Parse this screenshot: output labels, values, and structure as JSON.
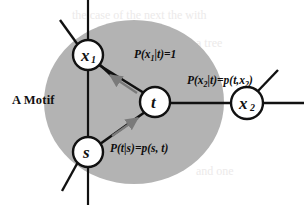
{
  "figure": {
    "title_text": "A Motif",
    "background_color": "#ffffff",
    "motif_region": {
      "name": "motif-ellipse",
      "fill_color": "#b3b3b3",
      "cx": 134,
      "cy": 102,
      "rx": 90,
      "ry": 82
    },
    "nodes": [
      {
        "id": "x1",
        "base": "x",
        "subscript": "1",
        "cx": 88,
        "cy": 55,
        "r": 15,
        "inside_motif": true
      },
      {
        "id": "t",
        "base": "t",
        "subscript": "",
        "cx": 155,
        "cy": 102,
        "r": 15,
        "inside_motif": true
      },
      {
        "id": "s",
        "base": "s",
        "subscript": "",
        "cx": 88,
        "cy": 152,
        "r": 15,
        "inside_motif": true
      },
      {
        "id": "x2",
        "base": "x",
        "subscript": "2",
        "cx": 247,
        "cy": 103,
        "r": 16,
        "inside_motif": false
      }
    ],
    "edge_labels": [
      {
        "id": "label-x1-t",
        "text": "P(x1|t)=1",
        "display": "P(x|t)=1",
        "x": 108,
        "y": 58
      },
      {
        "id": "label-t-x2",
        "text": "P(x2|t)=p(t,x2)",
        "display": "P(x|t)=p(t,x)",
        "x": 163,
        "y": 84
      },
      {
        "id": "label-s-t",
        "text": "P(t|s)=p(s, t)",
        "display": "P(t|s)=p(s, t)",
        "x": 110,
        "y": 152
      }
    ],
    "arrows": [
      {
        "id": "arrow-t-to-x1",
        "from": "t",
        "to": "x1",
        "color": "#7a7a7a",
        "direction": "up-left"
      },
      {
        "id": "arrow-s-to-t",
        "from": "s",
        "to": "t",
        "color": "#7a7a7a",
        "direction": "up-right"
      }
    ],
    "edges": [
      {
        "id": "edge-x1-t",
        "from": "x1",
        "to": "t",
        "color": "#111111"
      },
      {
        "id": "edge-s-t",
        "from": "s",
        "to": "t",
        "color": "#111111"
      },
      {
        "id": "edge-t-x2",
        "from": "t",
        "to": "x2",
        "color": "#111111"
      }
    ],
    "external_lines": [
      {
        "id": "vertical-backbone-line",
        "orientation": "vertical",
        "x": 88
      },
      {
        "id": "stub-x1-upleft",
        "orientation": "diagonal"
      },
      {
        "id": "stub-s-downleft",
        "orientation": "diagonal"
      },
      {
        "id": "stub-x2-upright",
        "orientation": "diagonal"
      },
      {
        "id": "line-x2-right",
        "orientation": "horizontal"
      }
    ]
  }
}
